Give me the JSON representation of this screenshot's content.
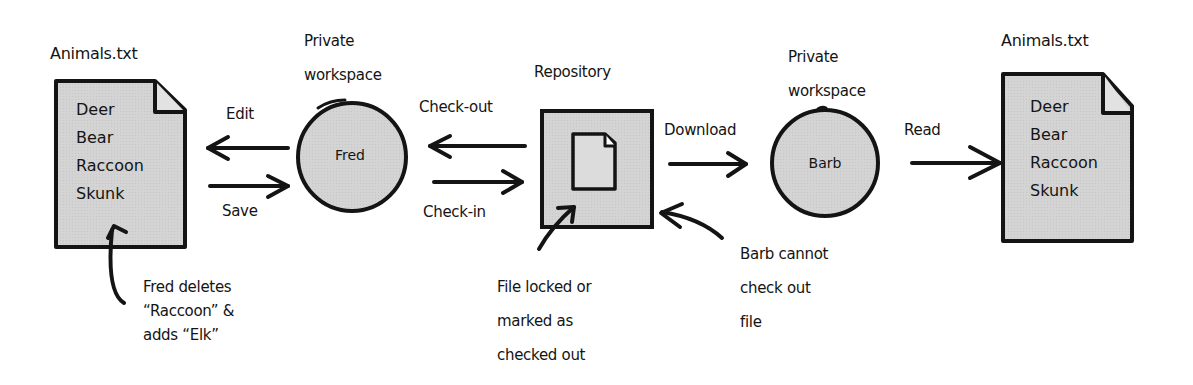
{
  "diagram": {
    "type": "check-out/check-in version control flow",
    "colors": {
      "stroke": "#141414",
      "fill": "#d3d3d3",
      "background": "#ffffff"
    },
    "left_file": {
      "title": "Animals.txt",
      "lines": [
        "Deer",
        "Bear",
        "Raccoon",
        "Skunk"
      ],
      "annotation": [
        "Fred deletes",
        "“Raccoon” &",
        "adds “Elk”"
      ]
    },
    "fred_workspace": {
      "label": [
        "Private",
        "workspace"
      ],
      "name": "Fred"
    },
    "repository": {
      "label": "Repository",
      "annotation": [
        "File locked or",
        "marked as",
        "checked out"
      ]
    },
    "barb_workspace": {
      "label": [
        "Private",
        "workspace"
      ],
      "name": "Barb",
      "annotation": [
        "Barb cannot",
        "check out",
        "file"
      ]
    },
    "right_file": {
      "title": "Animals.txt",
      "lines": [
        "Deer",
        "Bear",
        "Raccoon",
        "Skunk"
      ]
    },
    "edges": {
      "edit": "Edit",
      "save": "Save",
      "check_out": "Check-out",
      "check_in": "Check-in",
      "download": "Download",
      "read": "Read"
    }
  }
}
